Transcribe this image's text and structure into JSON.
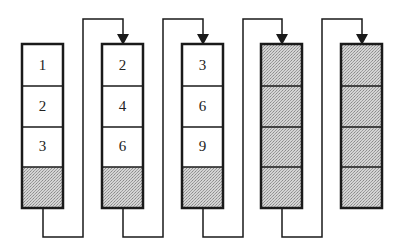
{
  "diagram": {
    "type": "chained memory blocks",
    "columns": [
      {
        "id": "col-1",
        "cells": [
          "1",
          "2",
          "3",
          ""
        ],
        "shaded": [
          false,
          false,
          false,
          true
        ]
      },
      {
        "id": "col-2",
        "cells": [
          "2",
          "4",
          "6",
          ""
        ],
        "shaded": [
          false,
          false,
          false,
          true
        ]
      },
      {
        "id": "col-3",
        "cells": [
          "3",
          "6",
          "9",
          ""
        ],
        "shaded": [
          false,
          false,
          false,
          true
        ]
      },
      {
        "id": "col-4",
        "cells": [
          "",
          "",
          "",
          ""
        ],
        "shaded": [
          true,
          true,
          true,
          true
        ]
      },
      {
        "id": "col-5",
        "cells": [
          "",
          "",
          "",
          ""
        ],
        "shaded": [
          true,
          true,
          true,
          true
        ]
      }
    ],
    "connectors": [
      {
        "from": "col-1",
        "to": "col-2",
        "arrow": "down-arrow-icon"
      },
      {
        "from": "col-2",
        "to": "col-3",
        "arrow": "down-arrow-icon"
      },
      {
        "from": "col-3",
        "to": "col-4",
        "arrow": "down-arrow-icon"
      },
      {
        "from": "col-4",
        "to": "col-5",
        "arrow": "down-arrow-icon"
      }
    ],
    "colors": {
      "stroke": "#1a1a1a",
      "shade": "#c8c8c8",
      "background": "#ffffff"
    }
  }
}
